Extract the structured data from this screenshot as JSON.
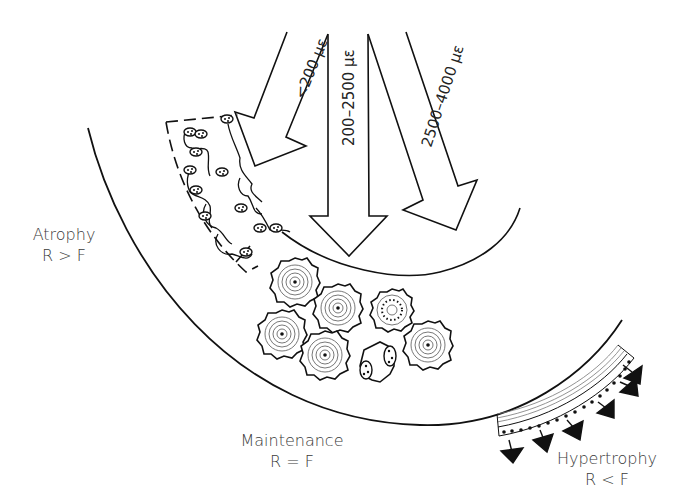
{
  "diagram": {
    "arrows": [
      {
        "id": "low",
        "label": "<200 με"
      },
      {
        "id": "mid",
        "label": "200–2500 με"
      },
      {
        "id": "high",
        "label": "2500–4000 με"
      }
    ],
    "labels": {
      "atrophy": {
        "title": "Atrophy",
        "relation": "R > F"
      },
      "maintenance": {
        "title": "Maintenance",
        "relation": "R = F"
      },
      "hypertrophy": {
        "title": "Hypertrophy",
        "relation": "R < F"
      }
    },
    "colors": {
      "stroke": "#111111",
      "background": "#ffffff",
      "text": "#3a3a3a"
    }
  }
}
